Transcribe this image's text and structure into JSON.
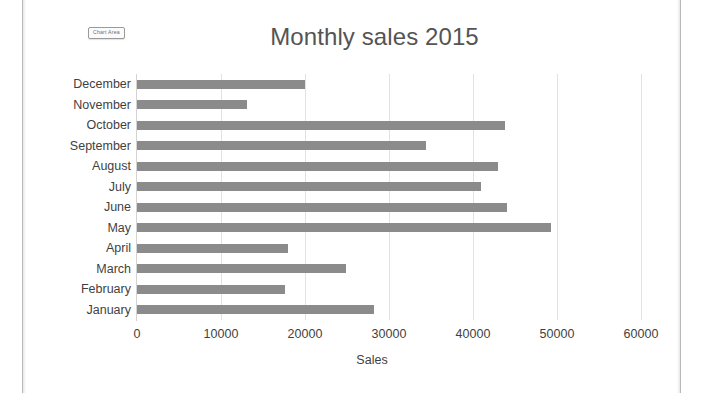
{
  "tooltip": {
    "label": "Chart Area"
  },
  "chart_data": {
    "type": "bar",
    "orientation": "horizontal",
    "title": "Monthly sales 2015",
    "xlabel": "Sales",
    "ylabel": "",
    "categories": [
      "December",
      "November",
      "October",
      "September",
      "August",
      "July",
      "June",
      "May",
      "April",
      "March",
      "February",
      "January"
    ],
    "values": [
      20000,
      13100,
      43800,
      34400,
      43000,
      41000,
      44000,
      49300,
      18000,
      24900,
      17600,
      28200
    ],
    "series": [
      {
        "name": "Sales",
        "values": [
          20000,
          13100,
          43800,
          34400,
          43000,
          41000,
          44000,
          49300,
          18000,
          24900,
          17600,
          28200
        ]
      }
    ],
    "xlim": [
      0,
      65000
    ],
    "xticks": [
      0,
      10000,
      20000,
      30000,
      40000,
      50000,
      60000
    ],
    "xtick_labels": [
      "0",
      "10000",
      "20000",
      "30000",
      "40000",
      "50000",
      "60000"
    ],
    "grid": "vertical",
    "legend": "none",
    "bar_color": "#8b8b8b",
    "gridline_color": "#e2e2e2",
    "text_color": "#3f3f3f",
    "title_color": "#545454"
  }
}
